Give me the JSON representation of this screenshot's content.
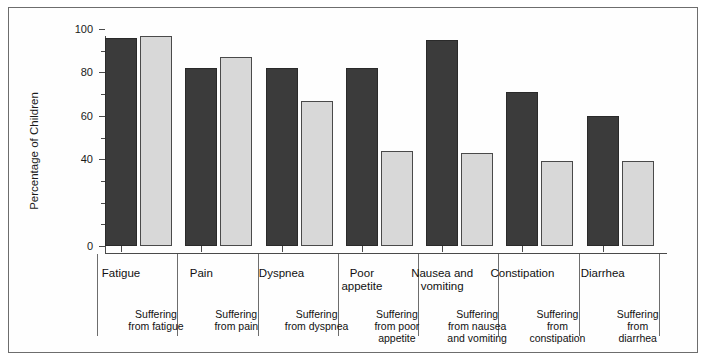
{
  "chart_data": {
    "type": "bar",
    "title": "",
    "subtitle": "",
    "xlabel": "",
    "ylabel": "Percentage of Children",
    "ylim": [
      0,
      100
    ],
    "y_ticks": [
      0,
      40,
      60,
      80,
      100
    ],
    "y_tick_labels": [
      "0",
      "40",
      "60",
      "80",
      "100"
    ],
    "y_minor_ticks": [
      10,
      20,
      30,
      50,
      70,
      90
    ],
    "grid": false,
    "legend": null,
    "legend_position": "none",
    "categories": [
      "Fatigue",
      "Pain",
      "Dyspnea",
      "Poor appetite",
      "Nausea and vomiting",
      "Constipation",
      "Diarrhea"
    ],
    "category_labels": [
      [
        "Fatigue"
      ],
      [
        "Pain"
      ],
      [
        "Dyspnea"
      ],
      [
        "Poor",
        "appetite"
      ],
      [
        "Nausea and",
        "vomiting"
      ],
      [
        "Constipation"
      ],
      [
        "Diarrhea"
      ]
    ],
    "sub_labels": [
      [
        "Suffering",
        "from fatigue"
      ],
      [
        "Suffering",
        "from pain"
      ],
      [
        "Suffering",
        "from dyspnea"
      ],
      [
        "Suffering",
        "from poor",
        "appetite"
      ],
      [
        "Suffering",
        "from nausea",
        "and vomiting"
      ],
      [
        "Suffering",
        "from",
        "constipation"
      ],
      [
        "Suffering",
        "from",
        "diarrhea"
      ]
    ],
    "series": [
      {
        "name": "dark",
        "color": "#3b3b3b",
        "values": [
          96,
          82,
          82,
          82,
          95,
          71,
          60
        ]
      },
      {
        "name": "light",
        "color": "#d8d8d8",
        "values": [
          97,
          87,
          67,
          44,
          43,
          39,
          39
        ]
      }
    ]
  },
  "axis": {
    "y_title": "Percentage of Children"
  }
}
